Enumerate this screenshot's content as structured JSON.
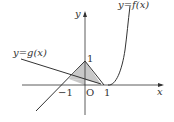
{
  "diagram": {
    "title": "",
    "axes": {
      "x_label": "x",
      "y_label": "y",
      "origin_label": "O"
    },
    "ticks": {
      "x_neg_one": "−1",
      "x_one": "1",
      "y_one": "1"
    },
    "curves": {
      "f_label": "y=f(x)",
      "g_label": "y=g(x)"
    },
    "colors": {
      "shade": "#c8c8c8",
      "stroke": "#333333"
    }
  }
}
